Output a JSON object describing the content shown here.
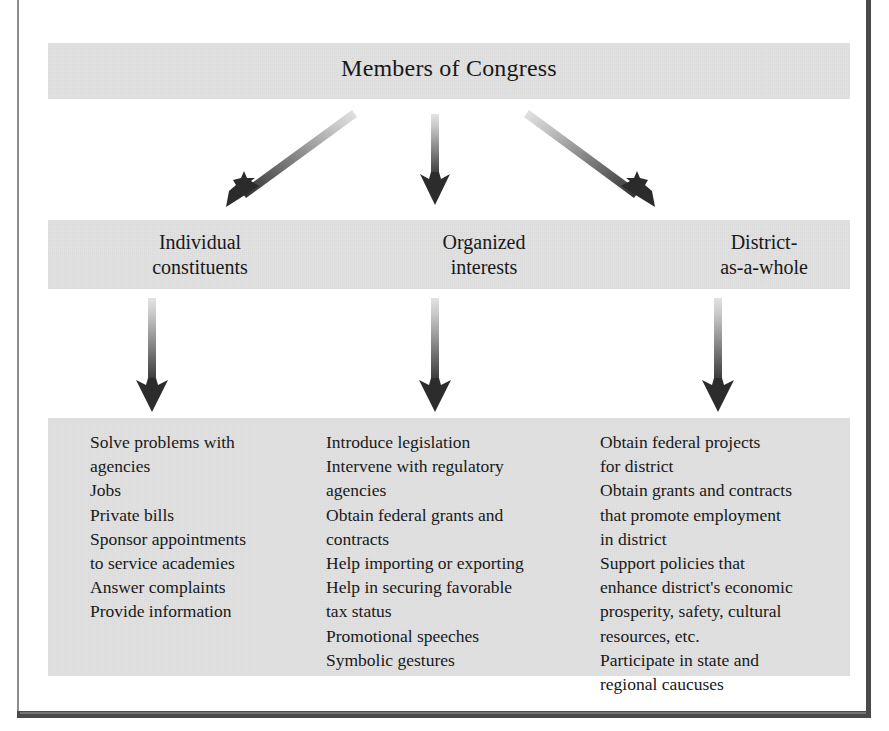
{
  "figure": {
    "title": "Members of Congress",
    "background_color": "#ffffff",
    "panel_color": "#e2e2e2",
    "text_color": "#18181a",
    "arrow_gradient": {
      "tail": "#d9d9d9",
      "head": "#2e2e2e"
    }
  },
  "categories": [
    {
      "label": "Individual\nconstituents"
    },
    {
      "label": "Organized\ninterests"
    },
    {
      "label": "District-\nas-a-whole"
    }
  ],
  "columns": [
    {
      "name": "individual-constituents-services",
      "text": "Solve problems with\n agencies\nJobs\nPrivate bills\nSponsor appointments\n to service academies\nAnswer complaints\nProvide information",
      "items": [
        "Solve problems with agencies",
        "Jobs",
        "Private bills",
        "Sponsor appointments to service academies",
        "Answer complaints",
        "Provide information"
      ]
    },
    {
      "name": "organized-interests-services",
      "text": "Introduce legislation\nIntervene with regulatory\n agencies\nObtain federal grants and\n contracts\nHelp importing or exporting\nHelp in securing favorable\n tax status\nPromotional speeches\nSymbolic gestures",
      "items": [
        "Introduce legislation",
        "Intervene with regulatory agencies",
        "Obtain federal grants and contracts",
        "Help importing or exporting",
        "Help in securing favorable tax status",
        "Promotional speeches",
        "Symbolic gestures"
      ]
    },
    {
      "name": "district-as-a-whole-services",
      "text": "Obtain federal projects\n for district\nObtain grants and contracts\n that promote employment\n in district\nSupport policies that\n enhance district's economic\n prosperity, safety, cultural\n resources, etc.\nParticipate in state and\n regional caucuses",
      "items": [
        "Obtain federal projects for district",
        "Obtain grants and contracts that promote employment in district",
        "Support policies that enhance district's economic prosperity, safety, cultural resources, etc.",
        "Participate in state and regional caucuses"
      ]
    }
  ],
  "arrows": {
    "from_title": [
      {
        "name": "arrow-to-individual-constituents",
        "direction": "down-left"
      },
      {
        "name": "arrow-to-organized-interests",
        "direction": "down"
      },
      {
        "name": "arrow-to-district-as-a-whole",
        "direction": "down-right"
      }
    ],
    "from_categories": [
      {
        "name": "arrow-individual-constituents-to-services",
        "direction": "down"
      },
      {
        "name": "arrow-organized-interests-to-services",
        "direction": "down"
      },
      {
        "name": "arrow-district-as-a-whole-to-services",
        "direction": "down"
      }
    ]
  }
}
